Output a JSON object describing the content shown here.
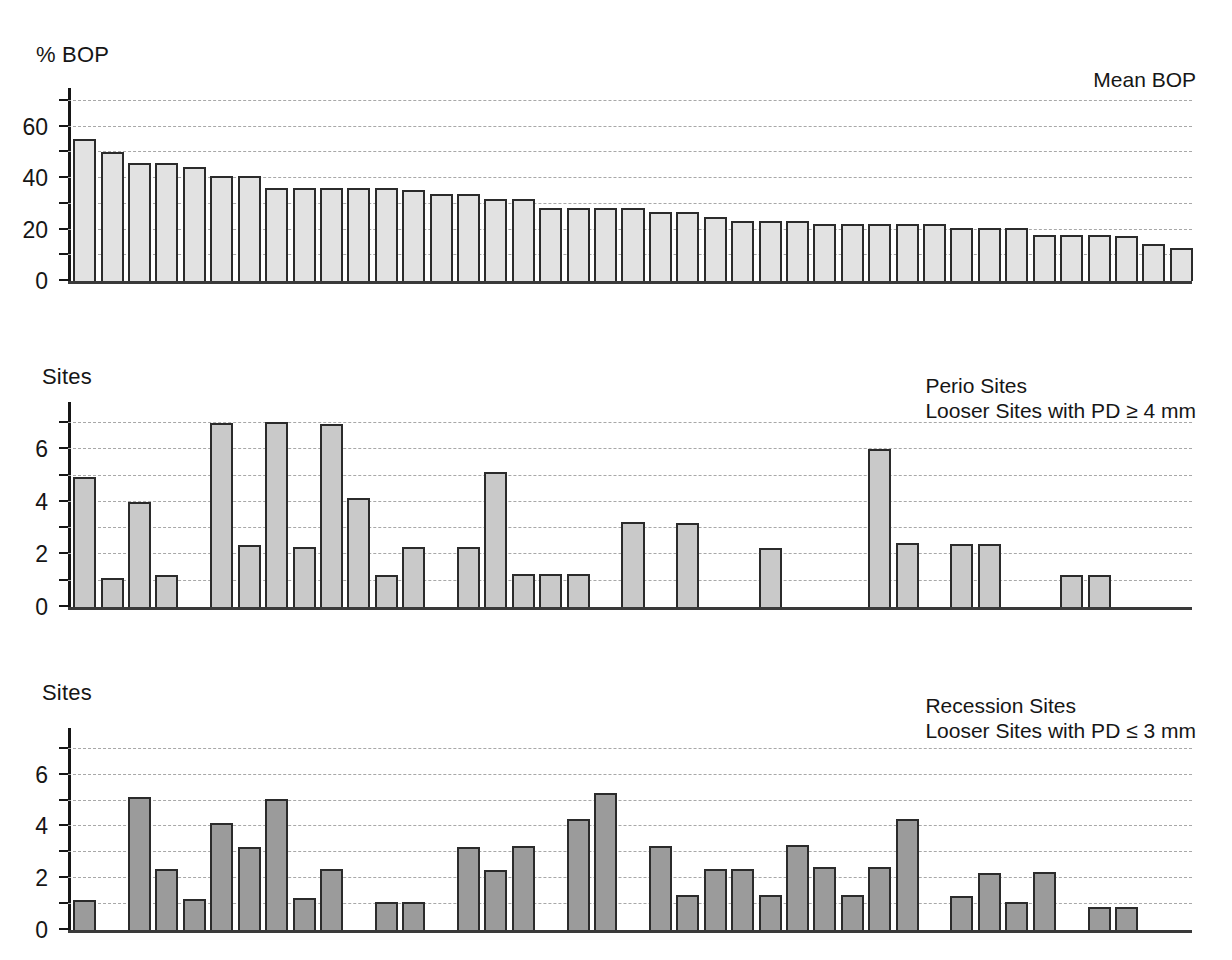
{
  "chart_data": [
    {
      "type": "bar",
      "id": "bop",
      "title": "Mean BOP",
      "ylabel": "% BOP",
      "xlabel": "",
      "grid": true,
      "legend_position": "top-right",
      "ylim": [
        0,
        75
      ],
      "yticks": [
        0,
        10,
        20,
        30,
        40,
        50,
        60,
        70
      ],
      "ytick_labels": [
        "0",
        "",
        "20",
        "",
        "40",
        "",
        "60",
        ""
      ],
      "gridline_values": [
        10,
        20,
        30,
        40,
        50,
        60,
        70
      ],
      "bar_color": "#e2e2e2",
      "bar_edge_color": "#2b2b2b",
      "categories": [
        "1",
        "2",
        "3",
        "4",
        "5",
        "6",
        "7",
        "8",
        "9",
        "10",
        "11",
        "12",
        "13",
        "14",
        "15",
        "16",
        "17",
        "18",
        "19",
        "20",
        "21",
        "22",
        "23",
        "24",
        "25",
        "26",
        "27",
        "28",
        "29",
        "30",
        "31",
        "32",
        "33",
        "34",
        "35",
        "36",
        "37",
        "38",
        "39",
        "40",
        "41"
      ],
      "values": [
        55,
        50,
        46,
        46,
        44.5,
        41,
        41,
        36,
        36,
        36,
        36,
        36,
        35.5,
        34,
        34,
        32,
        32,
        28.5,
        28.5,
        28.5,
        28.5,
        27,
        27,
        25,
        23.5,
        23.5,
        23.5,
        22,
        22,
        22,
        22,
        22,
        20.5,
        20.5,
        20.5,
        18,
        18,
        18,
        17.5,
        14.5,
        13
      ]
    },
    {
      "type": "bar",
      "id": "perio",
      "title": "Perio Sites",
      "subtitle": "Looser Sites with PD ≥ 4 mm",
      "ylabel": "Sites",
      "xlabel": "",
      "grid": true,
      "legend_position": "top-right",
      "ylim": [
        0,
        7.8
      ],
      "yticks": [
        0,
        1,
        2,
        3,
        4,
        5,
        6,
        7
      ],
      "ytick_labels": [
        "0",
        "",
        "2",
        "",
        "4",
        "",
        "6",
        ""
      ],
      "gridline_values": [
        1,
        2,
        3,
        4,
        5,
        6,
        7
      ],
      "bar_color": "#c9c9c9",
      "bar_edge_color": "#2b2b2b",
      "categories": [
        "1",
        "2",
        "3",
        "4",
        "5",
        "6",
        "7",
        "8",
        "9",
        "10",
        "11",
        "12",
        "13",
        "14",
        "15",
        "16",
        "17",
        "18",
        "19",
        "20",
        "21",
        "22",
        "23",
        "24",
        "25",
        "26",
        "27",
        "28",
        "29",
        "30",
        "31",
        "32",
        "33",
        "34",
        "35",
        "36",
        "37",
        "38",
        "39",
        "40",
        "41"
      ],
      "values": [
        4.95,
        1.1,
        4.0,
        1.2,
        0,
        7.0,
        2.35,
        7.05,
        2.3,
        6.95,
        4.15,
        1.2,
        2.3,
        0,
        2.3,
        5.15,
        1.25,
        1.25,
        1.25,
        0,
        3.25,
        0,
        3.2,
        0,
        0,
        2.25,
        0,
        0,
        0,
        6.0,
        2.45,
        0,
        2.4,
        2.4,
        0,
        0,
        1.2,
        1.2,
        0,
        0,
        0
      ]
    },
    {
      "type": "bar",
      "id": "recession",
      "title": "Recession Sites",
      "subtitle": "Looser Sites with PD ≤ 3 mm",
      "ylabel": "Sites",
      "xlabel": "",
      "grid": true,
      "legend_position": "top-right",
      "ylim": [
        0,
        7.8
      ],
      "yticks": [
        0,
        1,
        2,
        3,
        4,
        5,
        6,
        7
      ],
      "ytick_labels": [
        "0",
        "",
        "2",
        "",
        "4",
        "",
        "6",
        ""
      ],
      "gridline_values": [
        1,
        2,
        3,
        4,
        5,
        6,
        7
      ],
      "bar_color": "#9b9b9b",
      "bar_edge_color": "#2b2b2b",
      "categories": [
        "1",
        "2",
        "3",
        "4",
        "5",
        "6",
        "7",
        "8",
        "9",
        "10",
        "11",
        "12",
        "13",
        "14",
        "15",
        "16",
        "17",
        "18",
        "19",
        "20",
        "21",
        "22",
        "23",
        "24",
        "25",
        "26",
        "27",
        "28",
        "29",
        "30",
        "31",
        "32",
        "33",
        "34",
        "35",
        "36",
        "37",
        "38",
        "39",
        "40",
        "41"
      ],
      "values": [
        1.15,
        0,
        5.15,
        2.35,
        1.2,
        4.15,
        3.2,
        5.05,
        1.25,
        2.35,
        0,
        1.1,
        1.1,
        0,
        3.2,
        2.3,
        3.25,
        0,
        4.3,
        5.3,
        0,
        3.25,
        1.35,
        2.35,
        2.35,
        1.35,
        3.3,
        2.45,
        1.35,
        2.45,
        4.3,
        0,
        1.3,
        2.2,
        1.1,
        2.25,
        0,
        0.9,
        0.9,
        0,
        0
      ]
    }
  ],
  "panels": [
    {
      "axis_caption": "% BOP",
      "legend_line1": "Mean BOP",
      "legend_line2": "",
      "ytick_labels": [
        "0",
        "20",
        "40",
        "60"
      ]
    },
    {
      "axis_caption": "Sites",
      "legend_line1": "Perio Sites",
      "legend_line2": "Looser Sites with PD ≥ 4 mm",
      "ytick_labels": [
        "0",
        "2",
        "4",
        "6"
      ]
    },
    {
      "axis_caption": "Sites",
      "legend_line1": "Recession Sites",
      "legend_line2": "Looser Sites with PD ≤ 3 mm",
      "ytick_labels": [
        "0",
        "2",
        "4",
        "6"
      ]
    }
  ]
}
